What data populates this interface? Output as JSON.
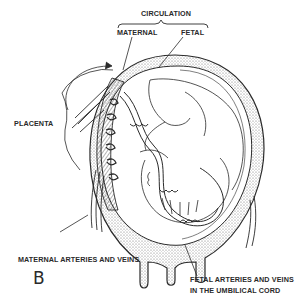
{
  "figure": {
    "panel_letter": "B",
    "colors": {
      "line": "#2a2a2a",
      "stipple": "#6a6a6a",
      "background": "#ffffff"
    }
  },
  "labels": {
    "circulation": "CIRCULATION",
    "maternal": "MATERNAL",
    "fetal": "FETAL",
    "placenta": "PLACENTA",
    "maternal_vessels": "MATERNAL ARTERIES AND VEINS",
    "fetal_vessels_line1": "FETAL ARTERIES AND VEINS",
    "fetal_vessels_line2": "IN THE UMBILICAL CORD"
  }
}
